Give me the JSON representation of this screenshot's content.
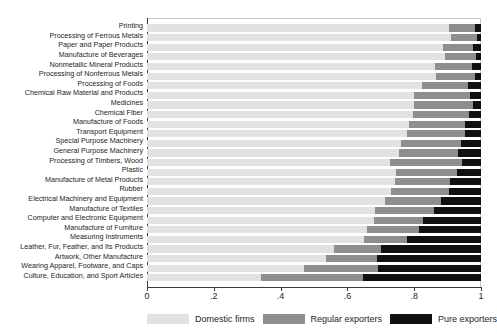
{
  "chart_data": {
    "type": "bar",
    "orientation": "horizontal",
    "stacked": true,
    "normalized": true,
    "title": "",
    "subtitle": "",
    "xlabel": "",
    "ylabel": "",
    "xlim": [
      0,
      1
    ],
    "xticks": [
      0,
      0.2,
      0.4,
      0.6,
      0.8,
      1
    ],
    "xtick_labels": [
      "0",
      ".2",
      ".4",
      ".6",
      ".8",
      "1"
    ],
    "grid": false,
    "legend_position": "bottom",
    "legend": [
      {
        "name": "Domestic firms",
        "color": "#e2e2e2"
      },
      {
        "name": "Regular exporters",
        "color": "#8e8e8e"
      },
      {
        "name": "Pure exporters",
        "color": "#111111"
      }
    ],
    "categories": [
      "Printing",
      "Processing of Ferrous Metals",
      "Paper and Paper Products",
      "Manufacture of Beverages",
      "Nonmetallic Mineral Products",
      "Processing of Nonferrous Metals",
      "Processing of Foods",
      "Chemical Raw Material and Products",
      "Medicines",
      "Chemical Fiber",
      "Manufacture of Foods",
      "Transport Equipment",
      "Special Purpose Machinery",
      "General Purpose Machinery",
      "Processing of Timbers, Wood",
      "Plastic",
      "Manufacture of Metal Products",
      "Rubber",
      "Electrical Machinery and Equipment",
      "Manufacture of Textiles",
      "Computer and Electronic Equipment",
      "Manufacture of Furniture",
      "Measuring Instruments",
      "Leather, Fur, Feather, and Its Products",
      "Artwork, Other Manufacture",
      "Wearing Apparel, Footware, and Caps",
      "Culture, Education, and Sport Articles"
    ],
    "series": [
      {
        "name": "Domestic firms",
        "color": "#e2e2e2",
        "values": [
          0.904,
          0.91,
          0.885,
          0.892,
          0.862,
          0.865,
          0.824,
          0.8,
          0.8,
          0.795,
          0.784,
          0.779,
          0.76,
          0.755,
          0.728,
          0.745,
          0.743,
          0.73,
          0.713,
          0.683,
          0.68,
          0.659,
          0.65,
          0.56,
          0.535,
          0.47,
          0.34
        ]
      },
      {
        "name": "Regular exporters",
        "color": "#8e8e8e",
        "values": [
          0.078,
          0.078,
          0.091,
          0.092,
          0.11,
          0.117,
          0.136,
          0.168,
          0.176,
          0.17,
          0.168,
          0.173,
          0.18,
          0.177,
          0.215,
          0.182,
          0.164,
          0.174,
          0.168,
          0.175,
          0.147,
          0.156,
          0.128,
          0.142,
          0.155,
          0.222,
          0.308
        ]
      },
      {
        "name": "Pure exporters",
        "color": "#111111",
        "values": [
          0.018,
          0.012,
          0.024,
          0.016,
          0.028,
          0.018,
          0.04,
          0.032,
          0.024,
          0.035,
          0.048,
          0.048,
          0.06,
          0.068,
          0.057,
          0.073,
          0.093,
          0.096,
          0.119,
          0.142,
          0.173,
          0.185,
          0.222,
          0.298,
          0.31,
          0.308,
          0.352
        ]
      }
    ]
  }
}
